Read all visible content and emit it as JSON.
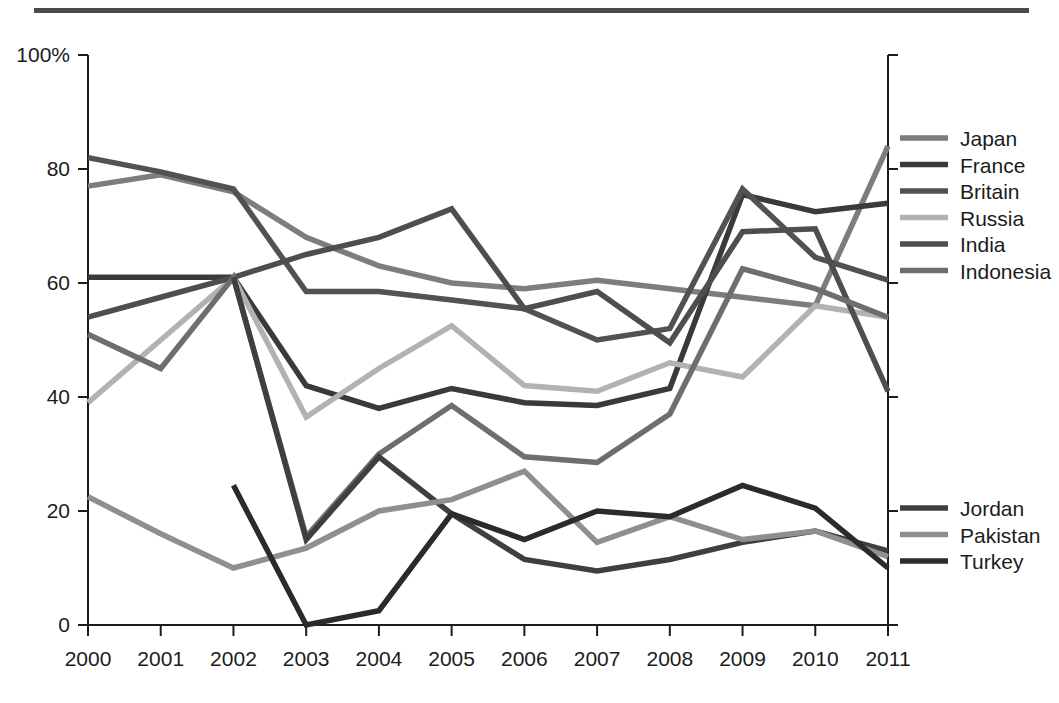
{
  "page": {
    "background": "#ffffff",
    "top_rule_color": "#4a4a4a"
  },
  "chart_data": {
    "type": "line",
    "title": "",
    "subtitle": "",
    "xlabel": "",
    "ylabel": "",
    "x": [
      2000,
      2001,
      2002,
      2003,
      2004,
      2005,
      2006,
      2007,
      2008,
      2009,
      2010,
      2011
    ],
    "categories": [
      "2000",
      "2001",
      "2002",
      "2003",
      "2004",
      "2005",
      "2006",
      "2007",
      "2008",
      "2009",
      "2010",
      "2011"
    ],
    "xlim": [
      2000,
      2011
    ],
    "ylim": [
      0,
      100
    ],
    "yticks": [
      0,
      20,
      40,
      60,
      80,
      100
    ],
    "ytick_labels": [
      "0",
      "20",
      "40",
      "60",
      "80",
      "100%"
    ],
    "grid": false,
    "legend_position": "right",
    "series": [
      {
        "name": "Japan",
        "color": "#7d7d7d",
        "values": [
          77,
          79,
          76,
          68,
          63,
          60,
          59,
          60.5,
          59,
          57.5,
          56,
          84
        ]
      },
      {
        "name": "France",
        "color": "#3a3a3a",
        "values": [
          61,
          61,
          61,
          42,
          38,
          41.5,
          39,
          38.5,
          41.5,
          75.5,
          72.5,
          74
        ]
      },
      {
        "name": "Britain",
        "color": "#525252",
        "values": [
          82,
          79.5,
          76.5,
          58.5,
          58.5,
          57,
          55.5,
          50,
          52,
          76.5,
          64.5,
          60.5
        ]
      },
      {
        "name": "Russia",
        "color": "#b2b2b2",
        "values": [
          39,
          50,
          61,
          36.5,
          45,
          52.5,
          42,
          41,
          46,
          43.5,
          56,
          54
        ]
      },
      {
        "name": "India",
        "color": "#4e4e4e",
        "values": [
          54,
          57.5,
          61,
          65,
          68,
          73,
          55.5,
          58.5,
          49.5,
          69,
          69.5,
          41
        ]
      },
      {
        "name": "Indonesia",
        "color": "#6e6e6e",
        "values": [
          51,
          45,
          61,
          15.5,
          30,
          38.5,
          29.5,
          28.5,
          37,
          62.5,
          59,
          54
        ]
      },
      {
        "name": "Jordan",
        "color": "#3f3f3f",
        "values": [
          null,
          null,
          61,
          15,
          29.5,
          19.5,
          11.5,
          9.5,
          11.5,
          14.5,
          16.5,
          13
        ]
      },
      {
        "name": "Pakistan",
        "color": "#8f8f8f",
        "values": [
          22.5,
          16,
          10,
          13.5,
          20,
          22,
          27,
          14.5,
          19,
          15,
          16.5,
          12
        ]
      },
      {
        "name": "Turkey",
        "color": "#2b2b2b",
        "values": [
          null,
          null,
          24.5,
          0,
          2.5,
          19.5,
          15,
          20,
          19,
          24.5,
          20.5,
          10
        ]
      }
    ]
  },
  "legend": {
    "group_top": [
      "Japan",
      "France",
      "Britain",
      "Russia",
      "India",
      "Indonesia"
    ],
    "group_bottom": [
      "Jordan",
      "Pakistan",
      "Turkey"
    ]
  }
}
